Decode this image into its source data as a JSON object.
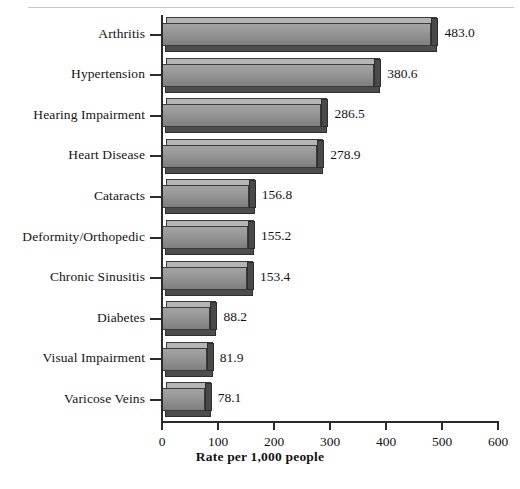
{
  "chart_data": {
    "type": "bar",
    "orientation": "horizontal",
    "title": "",
    "xlabel": "Rate per 1,000 people",
    "ylabel": "",
    "xlim": [
      0,
      600
    ],
    "xticks": [
      0,
      100,
      200,
      300,
      400,
      500,
      600
    ],
    "grid": false,
    "legend": null,
    "categories": [
      "Arthritis",
      "Hypertension",
      "Hearing Impairment",
      "Heart Disease",
      "Cataracts",
      "Deformity/Orthopedic",
      "Chronic Sinusitis",
      "Diabetes",
      "Visual Impairment",
      "Varicose Veins"
    ],
    "values": [
      483.0,
      380.6,
      286.5,
      278.9,
      156.8,
      155.2,
      153.4,
      88.2,
      81.9,
      78.1
    ],
    "value_labels": [
      "483.0",
      "380.6",
      "286.5",
      "278.9",
      "156.8",
      "155.2",
      "153.4",
      "88.2",
      "81.9",
      "78.1"
    ],
    "tick_labels": [
      "0",
      "100",
      "200",
      "300",
      "400",
      "500",
      "600"
    ],
    "bar_color": "#8f8f8f",
    "bar_edge_color": "#3a3a3a",
    "bar_depth_color": "#4a4a4a",
    "axis_color": "#2b2b2b",
    "text_color": "#141414",
    "background": "#ffffff"
  },
  "footer": {
    "caption": ""
  }
}
